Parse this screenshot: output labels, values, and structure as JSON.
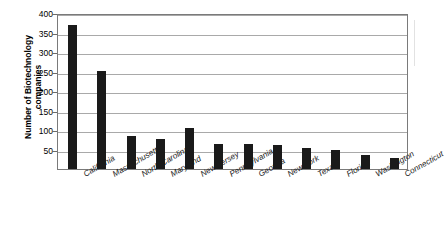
{
  "chart_data": {
    "type": "bar",
    "title": "",
    "xlabel": "",
    "ylabel": "Number of Biotechnology companies",
    "ylabel_lines": [
      "Number of Biotechnology",
      "companies"
    ],
    "categories": [
      "California",
      "Massachusetts",
      "North Carolina",
      "Maryland",
      "New Jersey",
      "Pennsylvania",
      "Georgia",
      "New York",
      "Texas",
      "Florida",
      "Washington",
      "Connecticut"
    ],
    "values": [
      370,
      252,
      85,
      78,
      105,
      65,
      63,
      62,
      55,
      50,
      35,
      28
    ],
    "ylim": [
      0,
      400
    ],
    "ytick_values": [
      400,
      350,
      300,
      250,
      200,
      150,
      100,
      50
    ],
    "ytick_labels": [
      "400",
      "350",
      "300",
      "250",
      "200",
      "150",
      "100",
      "50"
    ],
    "grid": "horizontal",
    "legend": "none",
    "bar_color": "#1a1a1a",
    "gridline_color": "#a9a9a9",
    "frame_color": "#7a7a7a",
    "background_color": "#ffffff",
    "xtick_label_rotation": -30
  }
}
